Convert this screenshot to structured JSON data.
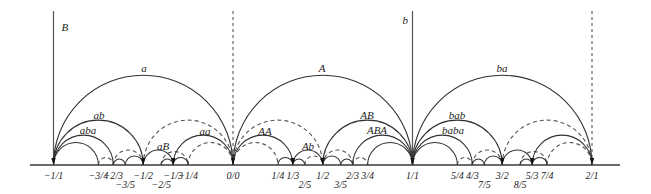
{
  "diagram": {
    "colors": {
      "solid": "#333333",
      "dashed": "#555555",
      "text": "#222222",
      "background": "#ffffff"
    },
    "axis": {
      "y": 165,
      "x_start": 30,
      "x_end": 620,
      "origin_x": 233,
      "unit_px": 179.5
    },
    "vertical_lines": [
      {
        "value": -1,
        "style": "solid",
        "label": "B",
        "label_dx": 8,
        "label_y": 31
      },
      {
        "value": 0,
        "style": "dashed",
        "label": "",
        "label_dx": 0,
        "label_y": 0
      },
      {
        "value": 1,
        "style": "solid",
        "label": "b",
        "label_dx": -10,
        "label_y": 24
      },
      {
        "value": 2,
        "style": "dashed",
        "label": "",
        "label_dx": 0,
        "label_y": 0
      }
    ],
    "vertical_top_y": 11,
    "solid_arcs": [
      [
        -1,
        0
      ],
      [
        -1,
        -0.5
      ],
      [
        -1,
        -0.6667
      ],
      [
        -1,
        -0.75
      ],
      [
        -0.6667,
        -0.6
      ],
      [
        -0.6,
        -0.5
      ],
      [
        -0.5,
        -0.3333
      ],
      [
        -0.4,
        -0.3333
      ],
      [
        -0.3333,
        -0.25
      ],
      [
        -0.3333,
        0
      ],
      [
        0,
        1
      ],
      [
        0,
        0.3333
      ],
      [
        0.25,
        0.3333
      ],
      [
        0.3333,
        0.4
      ],
      [
        0.3333,
        0.5
      ],
      [
        0.5,
        0.6
      ],
      [
        0.6,
        0.6667
      ],
      [
        0.5,
        1
      ],
      [
        0.6667,
        1
      ],
      [
        0.75,
        1
      ],
      [
        1,
        2
      ],
      [
        1,
        1.5
      ],
      [
        1,
        1.3333
      ],
      [
        1,
        1.25
      ],
      [
        1.3333,
        1.4
      ],
      [
        1.4,
        1.5
      ],
      [
        1.5,
        1.6667
      ],
      [
        1.6,
        1.6667
      ],
      [
        1.6667,
        1.75
      ],
      [
        1.6667,
        2
      ]
    ],
    "dashed_arcs": [
      [
        -0.5,
        0
      ],
      [
        -0.25,
        0
      ],
      [
        -0.6667,
        -0.5
      ],
      [
        -0.75,
        -0.6667
      ],
      [
        -0.4,
        -0.25
      ],
      [
        0,
        0.5
      ],
      [
        0,
        0.25
      ],
      [
        0.5,
        0.6667
      ],
      [
        0.6667,
        0.75
      ],
      [
        0.4,
        0.5
      ],
      [
        1.5,
        2
      ],
      [
        1.75,
        2
      ],
      [
        1.3333,
        1.5
      ],
      [
        1.25,
        1.3333
      ],
      [
        1.6,
        1.75
      ]
    ],
    "word_labels": [
      {
        "text": "a",
        "x": 144,
        "y": 72
      },
      {
        "text": "ab",
        "x": 99,
        "y": 119
      },
      {
        "text": "aba",
        "x": 88,
        "y": 134
      },
      {
        "text": "aB",
        "x": 163,
        "y": 150
      },
      {
        "text": "aa",
        "x": 205,
        "y": 135
      },
      {
        "text": "A",
        "x": 322,
        "y": 72
      },
      {
        "text": "AA",
        "x": 265,
        "y": 135
      },
      {
        "text": "Ab",
        "x": 308,
        "y": 150
      },
      {
        "text": "AB",
        "x": 367,
        "y": 119
      },
      {
        "text": "ABA",
        "x": 377,
        "y": 134
      },
      {
        "text": "ba",
        "x": 502,
        "y": 72
      },
      {
        "text": "bab",
        "x": 457,
        "y": 119
      },
      {
        "text": "baba",
        "x": 453,
        "y": 134
      }
    ],
    "tick_labels": [
      {
        "text": "−1/1",
        "value": -1,
        "row": 0
      },
      {
        "text": "−3/4",
        "value": -0.75,
        "row": 0
      },
      {
        "text": "−2/3",
        "value": -0.6667,
        "row": 0
      },
      {
        "text": "−3/5",
        "value": -0.6,
        "row": 1
      },
      {
        "text": "−1/2",
        "value": -0.5,
        "row": 0
      },
      {
        "text": "−2/5",
        "value": -0.4,
        "row": 1
      },
      {
        "text": "−1/3",
        "value": -0.3333,
        "row": 0
      },
      {
        "text": "−1/4",
        "value": -0.25,
        "row": 0
      },
      {
        "text": "0/0",
        "value": 0,
        "row": 0
      },
      {
        "text": "1/4",
        "value": 0.25,
        "row": 0
      },
      {
        "text": "1/3",
        "value": 0.3333,
        "row": 0
      },
      {
        "text": "2/5",
        "value": 0.4,
        "row": 1
      },
      {
        "text": "1/2",
        "value": 0.5,
        "row": 0
      },
      {
        "text": "3/5",
        "value": 0.6,
        "row": 1
      },
      {
        "text": "2/3",
        "value": 0.6667,
        "row": 0
      },
      {
        "text": "3/4",
        "value": 0.75,
        "row": 0
      },
      {
        "text": "1/1",
        "value": 1,
        "row": 0
      },
      {
        "text": "5/4",
        "value": 1.25,
        "row": 0
      },
      {
        "text": "4/3",
        "value": 1.3333,
        "row": 0
      },
      {
        "text": "7/5",
        "value": 1.4,
        "row": 1
      },
      {
        "text": "3/2",
        "value": 1.5,
        "row": 0
      },
      {
        "text": "8/5",
        "value": 1.6,
        "row": 1
      },
      {
        "text": "5/3",
        "value": 1.6667,
        "row": 0
      },
      {
        "text": "7/4",
        "value": 1.75,
        "row": 0
      },
      {
        "text": "2/1",
        "value": 2,
        "row": 0
      }
    ],
    "cusp_points": [
      -1,
      -0.5,
      -0.3333,
      0,
      0.3333,
      0.5,
      1,
      1.5,
      1.6667,
      2
    ]
  }
}
